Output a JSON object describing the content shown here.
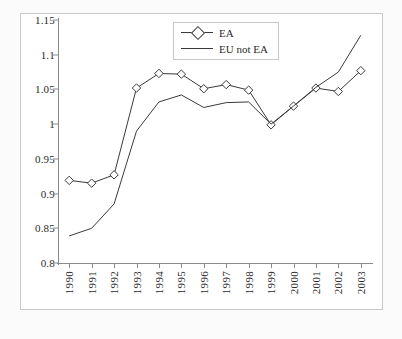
{
  "chart_data": {
    "type": "line",
    "title": "",
    "subtitle": "",
    "xlabel": "",
    "ylabel": "",
    "categories": [
      "1990",
      "1991",
      "1992",
      "1993",
      "1994",
      "1995",
      "1996",
      "1997",
      "1998",
      "1999",
      "2000",
      "2001",
      "2002",
      "2003"
    ],
    "ylim": [
      0.8,
      1.15
    ],
    "yticks": [
      "0.8",
      "0.85",
      "0.9",
      "0.95",
      "1",
      "1.05",
      "1.1",
      "1.15"
    ],
    "ytick_values": [
      0.8,
      0.85,
      0.9,
      0.95,
      1.0,
      1.05,
      1.1,
      1.15
    ],
    "grid": false,
    "legend_position": "top-center",
    "series": [
      {
        "name": "EA",
        "marker": "diamond",
        "color": "#3a3a3a",
        "values": [
          0.919,
          0.915,
          0.927,
          1.052,
          1.073,
          1.072,
          1.051,
          1.057,
          1.049,
          0.999,
          1.026,
          1.052,
          1.047,
          1.077
        ]
      },
      {
        "name": "EU not EA",
        "marker": "none",
        "color": "#3a3a3a",
        "values": [
          0.839,
          0.85,
          0.885,
          0.99,
          1.032,
          1.042,
          1.024,
          1.031,
          1.032,
          1.0,
          1.026,
          1.053,
          1.075,
          1.128
        ]
      }
    ]
  },
  "legend": {
    "items": [
      {
        "label": "EA"
      },
      {
        "label": "EU not EA"
      }
    ]
  },
  "colors": {
    "line": "#3a3a3a",
    "axis": "#8a8a8a",
    "frame": "#c9c9c9",
    "text": "#2b2b2b",
    "plot_background": "#ffffff",
    "figure_background": "#fbfbfb"
  }
}
